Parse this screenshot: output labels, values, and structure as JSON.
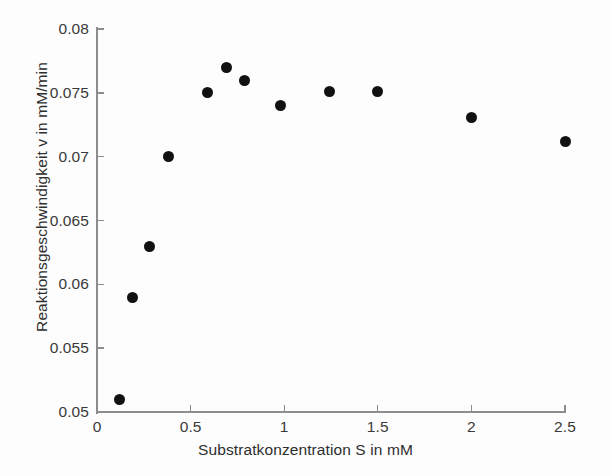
{
  "chart_data": {
    "type": "scatter",
    "title": "",
    "xlabel": "Substratkonzentration S in mM",
    "ylabel": "Reaktionsgeschwindigkeit v in mM/min",
    "xlim": [
      0,
      2.5
    ],
    "ylim": [
      0.05,
      0.08
    ],
    "xticks": [
      0,
      0.5,
      1,
      1.5,
      2,
      2.5
    ],
    "xticklabels": [
      "0",
      "0.5",
      "1",
      "1.5",
      "2",
      "2.5"
    ],
    "yticks": [
      0.05,
      0.055,
      0.06,
      0.065,
      0.07,
      0.075,
      0.08
    ],
    "yticklabels": [
      "0.05",
      "0.055",
      "0.06",
      "0.065",
      "0.07",
      "0.075",
      "0.08"
    ],
    "grid": false,
    "legend": null,
    "marker": "filled-circle",
    "marker_color": "#111111",
    "axis_color": "#8d8d8d",
    "background": "#fdfdfd",
    "x": [
      0.12,
      0.19,
      0.28,
      0.38,
      0.59,
      0.69,
      0.79,
      0.98,
      1.24,
      1.5,
      2.0,
      2.5
    ],
    "y": [
      0.051,
      0.059,
      0.063,
      0.07,
      0.075,
      0.077,
      0.076,
      0.074,
      0.0751,
      0.0751,
      0.0731,
      0.0712
    ],
    "points": [
      {
        "x": 0.12,
        "y": 0.051
      },
      {
        "x": 0.19,
        "y": 0.059
      },
      {
        "x": 0.28,
        "y": 0.063
      },
      {
        "x": 0.38,
        "y": 0.07
      },
      {
        "x": 0.59,
        "y": 0.075
      },
      {
        "x": 0.69,
        "y": 0.077
      },
      {
        "x": 0.79,
        "y": 0.076
      },
      {
        "x": 0.98,
        "y": 0.074
      },
      {
        "x": 1.24,
        "y": 0.0751
      },
      {
        "x": 1.5,
        "y": 0.0751
      },
      {
        "x": 2.0,
        "y": 0.0731
      },
      {
        "x": 2.5,
        "y": 0.0712
      }
    ]
  }
}
